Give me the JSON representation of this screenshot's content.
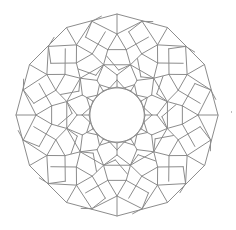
{
  "figure": {
    "symmetry": 12,
    "center": [
      117,
      115
    ],
    "stroke_color": "#8c8c8c",
    "stroke_width": 1,
    "background": "#ffffff",
    "outer_polygon": {
      "sides": 12,
      "radius": 101,
      "rotation_deg": 0
    },
    "inner_star": {
      "polygons": [
        {
          "sides": 12,
          "radius": 28,
          "rotation_deg": 0
        },
        {
          "sides": 12,
          "radius": 28,
          "rotation_deg": 15
        }
      ]
    },
    "rings": [
      {
        "sides": 12,
        "radius": 52,
        "rotation_deg": 15
      }
    ],
    "sector_segments": [
      [
        [
          28,
          0
        ],
        [
          40,
          0
        ]
      ],
      [
        [
          40,
          0
        ],
        [
          52,
          15
        ]
      ],
      [
        [
          40,
          0
        ],
        [
          52,
          -15
        ]
      ],
      [
        [
          52,
          15
        ],
        [
          66,
          8
        ]
      ],
      [
        [
          66,
          8
        ],
        [
          66,
          -8
        ]
      ],
      [
        [
          52,
          -15
        ],
        [
          66,
          -8
        ]
      ],
      [
        [
          66,
          8
        ],
        [
          81,
          0
        ]
      ],
      [
        [
          66,
          -8
        ],
        [
          81,
          0
        ]
      ],
      [
        [
          81,
          0
        ],
        [
          97,
          15
        ]
      ],
      [
        [
          81,
          0
        ],
        [
          97,
          -15
        ]
      ],
      [
        [
          66,
          8
        ],
        [
          84,
          22
        ]
      ],
      [
        [
          66,
          -8
        ],
        [
          84,
          -22
        ]
      ],
      [
        [
          84,
          22
        ],
        [
          97,
          15
        ]
      ],
      [
        [
          97,
          15
        ],
        [
          100,
          9
        ]
      ],
      [
        [
          81,
          0
        ],
        [
          101,
          0
        ]
      ],
      [
        [
          28,
          15
        ],
        [
          35,
          30
        ]
      ],
      [
        [
          28,
          -15
        ],
        [
          35,
          -30
        ]
      ],
      [
        [
          52,
          15
        ],
        [
          45,
          28
        ]
      ],
      [
        [
          45,
          28
        ],
        [
          60,
          40
        ]
      ]
    ]
  }
}
